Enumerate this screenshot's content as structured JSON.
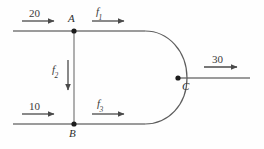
{
  "figure": {
    "type": "flow-network-diagram",
    "background_color": "#fefefe",
    "stroke_color": "#6b6b6b",
    "curve_color": "#555555",
    "text_color": "#333333",
    "arrow_color": "#4a4a4a",
    "width": 264,
    "height": 149
  },
  "nodes": [
    {
      "id": "A",
      "label": "A",
      "x": 74,
      "y": 31,
      "label_x": 68,
      "label_y": 14
    },
    {
      "id": "B",
      "label": "B",
      "x": 74,
      "y": 124,
      "label_x": 69,
      "label_y": 129
    },
    {
      "id": "C",
      "label": "C",
      "x": 178,
      "y": 78,
      "label_x": 182,
      "label_y": 81
    }
  ],
  "edges": [
    {
      "id": "inflow-top",
      "label": "20",
      "label_x": 29,
      "label_y": 10,
      "arrow": {
        "x1": 22,
        "y1": 21,
        "x2": 55,
        "y2": 21,
        "direction": "right"
      }
    },
    {
      "id": "edge-f1",
      "label": "f",
      "subscript": "1",
      "label_x": 96,
      "label_y": 8,
      "arrow": {
        "x1": 92,
        "y1": 21,
        "x2": 125,
        "y2": 21,
        "direction": "right"
      }
    },
    {
      "id": "edge-f2",
      "label": "f",
      "subscript": "2",
      "label_x": 53,
      "label_y": 66,
      "arrow": {
        "x1": 68,
        "y1": 60,
        "x2": 68,
        "y2": 91,
        "direction": "down"
      }
    },
    {
      "id": "inflow-bottom",
      "label": "10",
      "label_x": 29,
      "label_y": 103,
      "arrow": {
        "x1": 22,
        "y1": 114,
        "x2": 55,
        "y2": 114,
        "direction": "right"
      }
    },
    {
      "id": "edge-f3",
      "label": "f",
      "subscript": "3",
      "label_x": 97,
      "label_y": 100,
      "arrow": {
        "x1": 92,
        "y1": 114,
        "x2": 125,
        "y2": 114,
        "direction": "right"
      }
    },
    {
      "id": "outflow",
      "label": "30",
      "label_x": 212,
      "label_y": 56,
      "arrow": {
        "x1": 204,
        "y1": 67,
        "x2": 238,
        "y2": 67,
        "direction": "right"
      }
    }
  ],
  "paths": {
    "top_line": {
      "x1": 13,
      "y1": 31,
      "x2": 145,
      "y2": 31
    },
    "bottom_line": {
      "x1": 13,
      "y1": 124,
      "x2": 145,
      "y2": 124
    },
    "vertical_line": {
      "x1": 74,
      "y1": 31,
      "x2": 74,
      "y2": 124
    },
    "output_line": {
      "x1": 178,
      "y1": 78,
      "x2": 250,
      "y2": 78
    },
    "arc": "M 145 31 C 168 31, 187 51, 187 78 C 187 105, 168 124, 145 124"
  }
}
